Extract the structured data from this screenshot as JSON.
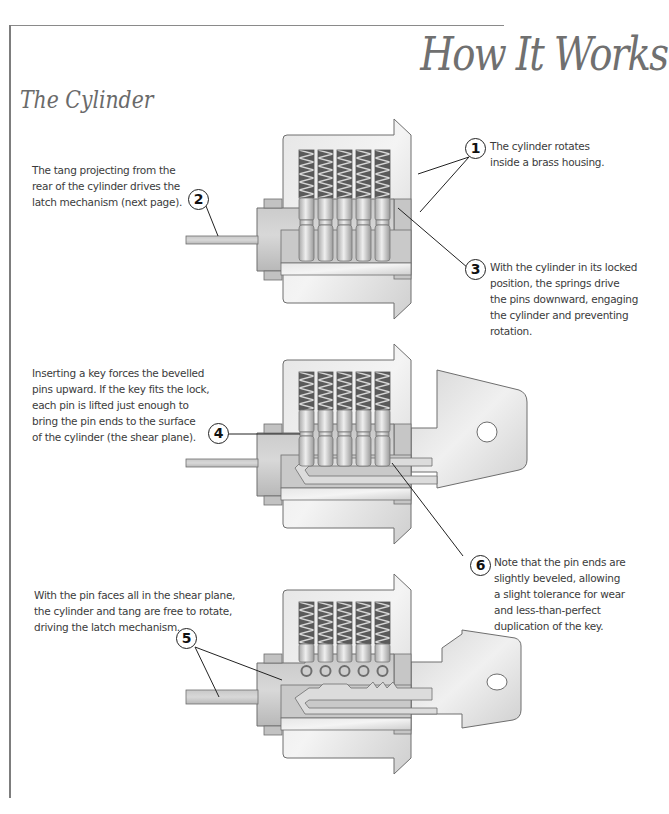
{
  "page": {
    "title": "How It Works",
    "section_title": "The Cylinder"
  },
  "callouts": [
    {
      "number": "1",
      "text": "The cylinder rotates inside a brass housing.",
      "lines": [
        "The cylinder rotates",
        "inside a brass housing."
      ]
    },
    {
      "number": "2",
      "text": "The tang projecting from the rear of the cylinder drives the latch mechanism (next page).",
      "lines": [
        "The tang projecting from the",
        "rear of the cylinder drives the",
        "latch mechanism (next page)."
      ]
    },
    {
      "number": "3",
      "text": "With the cylinder in its locked position, the springs drive the pins downward, engaging the cylinder and preventing rotation.",
      "lines": [
        "With the cylinder in its locked",
        "position, the springs drive",
        "the pins downward, engaging",
        "the cylinder and preventing",
        "rotation."
      ]
    },
    {
      "number": "4",
      "text": "Inserting a key forces the bevelled pins upward. If the key fits the lock, each pin is lifted just enough to bring the pin ends to the surface of the cylinder (the shear plane).",
      "lines": [
        "Inserting a key forces the bevelled",
        "pins upward. If the key fits the lock,",
        "each pin is lifted just enough to",
        "bring the pin ends to the surface",
        "of the cylinder (the shear plane)."
      ]
    },
    {
      "number": "5",
      "text": "With the pin faces all in the shear plane, the cylinder and tang are free to rotate, driving the latch mechanism.",
      "lines": [
        "With the pin faces all in the shear plane,",
        "the cylinder and tang are free to rotate,",
        "driving the latch mechanism."
      ]
    },
    {
      "number": "6",
      "text": "Note that the pin ends are slightly beveled, allowing a slight tolerance for wear and less-than-perfect duplication of the key.",
      "lines": [
        "Note that the pin ends are",
        "slightly beveled, allowing",
        "a slight tolerance for wear",
        "and less-than-perfect",
        "duplication of the key."
      ]
    }
  ],
  "diagrams": [
    {
      "name": "locked-cylinder",
      "state": "locked, no key"
    },
    {
      "name": "key-inserted-cylinder",
      "state": "key inserted, pins lifted to shear plane"
    },
    {
      "name": "rotated-cylinder",
      "state": "cylinder rotated with key"
    }
  ],
  "colors": {
    "housing": "#d9d9d9",
    "cylinder": "#bdbdbd",
    "outline": "#6e6e6e",
    "spring": "#4a4a4a",
    "title_gray": "#707070"
  }
}
